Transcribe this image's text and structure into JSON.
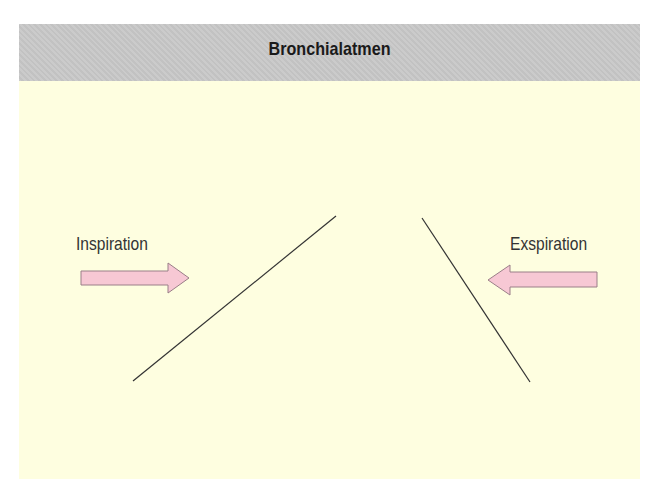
{
  "title": "Bronchialatmen",
  "labels": {
    "inspiration": "Inspiration",
    "expiration": "Exspiration"
  },
  "arrows": [
    {
      "name": "inspiration-arrow",
      "direction": "right",
      "fill": "#f7c8d4",
      "stroke": "#9a7f88"
    },
    {
      "name": "expiration-arrow",
      "direction": "left",
      "fill": "#f7c8d4",
      "stroke": "#9a7f88"
    }
  ],
  "colors": {
    "header_bg": "#c8c8c8",
    "panel_bg": "#fefee0",
    "line": "#333333"
  }
}
